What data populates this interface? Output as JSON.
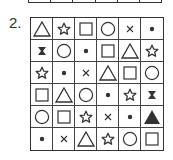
{
  "puzzle": {
    "number_label": "2.",
    "rows": [
      [
        "triangle",
        "star",
        "square",
        "circle",
        "x",
        "dot"
      ],
      [
        "bowtie-x",
        "circle",
        "dot",
        "square",
        "triangle",
        "star"
      ],
      [
        "star",
        "dot",
        "x",
        "triangle",
        "square",
        "circle"
      ],
      [
        "square",
        "triangle",
        "circle",
        "dot",
        "star",
        "bowtie-x"
      ],
      [
        "circle",
        "square",
        "star",
        "x",
        "dot",
        "filled-triangle"
      ],
      [
        "dot",
        "x",
        "triangle",
        "star",
        "circle",
        "square"
      ]
    ]
  },
  "colors": {
    "line": "#333333",
    "background": "#ffffff"
  }
}
